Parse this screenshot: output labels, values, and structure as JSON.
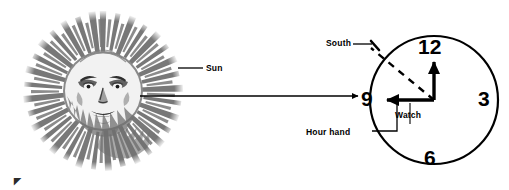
{
  "diagram": {
    "background_color": "#ffffff",
    "ink_color": "#000000",
    "sun_tone": "#7a7a7a"
  },
  "sun": {
    "icon": "sun-face-woodcut-icon",
    "label": "Sun",
    "leader_line": "sun-leader-line"
  },
  "sight_line": {
    "name": "sun-to-watch-arrow",
    "description": "horizontal arrow from sun toward watch"
  },
  "watch": {
    "label": "Watch",
    "numerals": [
      "12",
      "3",
      "6",
      "9"
    ],
    "hour_hand": {
      "label": "Hour hand",
      "points_to": "9"
    },
    "minute_hand": {
      "points_to": "12"
    },
    "south": {
      "label": "South",
      "marker": "dashed-bisector-line"
    }
  },
  "artifacts": {
    "corner_mark": "◤"
  }
}
